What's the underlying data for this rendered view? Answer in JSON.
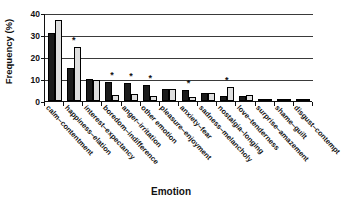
{
  "chart_data": {
    "type": "bar",
    "title": "",
    "xlabel": "Emotion",
    "ylabel": "Frequency (%)",
    "ylim": [
      0,
      40
    ],
    "yticks": [
      0,
      10,
      20,
      30,
      40
    ],
    "grid": true,
    "legend": "none",
    "categories": [
      "calm–contentment",
      "happiness–elation",
      "interest–expectancy",
      "boredom–indifference",
      "anger–irritation",
      "other emotion",
      "pleasure–enjoyment",
      "anxiety–fear",
      "sadness–melancholy",
      "nostalgia–longing",
      "love–tenderness",
      "surprise–amazement",
      "shame–guilt",
      "disgust–contempt"
    ],
    "series": [
      {
        "name": "dark",
        "values": [
          31.0,
          14.8,
          9.8,
          8.8,
          8.2,
          7.4,
          5.4,
          5.2,
          3.7,
          2.2,
          2.1,
          0.5,
          0.3,
          0.2
        ]
      },
      {
        "name": "light",
        "values": [
          37.0,
          24.6,
          9.7,
          2.6,
          3.1,
          2.3,
          5.4,
          1.7,
          3.6,
          6.4,
          2.9,
          0.6,
          0.7,
          0.2
        ]
      }
    ],
    "annotations": [
      {
        "category_index": 1,
        "marker": "*"
      },
      {
        "category_index": 3,
        "marker": "*"
      },
      {
        "category_index": 4,
        "marker": "*"
      },
      {
        "category_index": 5,
        "marker": "*"
      },
      {
        "category_index": 7,
        "marker": "*"
      },
      {
        "category_index": 9,
        "marker": "*"
      }
    ]
  }
}
